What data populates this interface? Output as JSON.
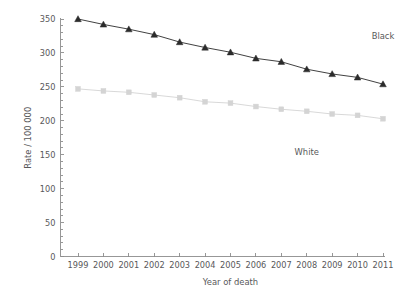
{
  "chart_data": {
    "type": "line",
    "title": "",
    "xlabel": "Year of death",
    "ylabel": "Rate / 100 000",
    "x": [
      1999,
      2000,
      2001,
      2002,
      2003,
      2004,
      2005,
      2006,
      2007,
      2008,
      2009,
      2010,
      2011
    ],
    "xticklabels": [
      "1999",
      "2000",
      "2001",
      "2002",
      "2003",
      "2004",
      "2005",
      "2006",
      "2007",
      "2008",
      "2009",
      "2010",
      "2011"
    ],
    "yticks": [
      0,
      50,
      100,
      150,
      200,
      250,
      300,
      350
    ],
    "yticklabels": [
      "0",
      "50",
      "100",
      "150",
      "200",
      "250",
      "300",
      "350"
    ],
    "ylim": [
      0,
      350
    ],
    "xlim": [
      1999,
      2011
    ],
    "grid": false,
    "legend": "inline-annotations",
    "series": [
      {
        "name": "Black",
        "marker": "triangle",
        "color": "#2b2b2b",
        "annotation": "Black",
        "annotation_x": 2011,
        "annotation_y": 320,
        "values": [
          350,
          342,
          335,
          327,
          316,
          308,
          301,
          292,
          287,
          276,
          269,
          264,
          254
        ]
      },
      {
        "name": "White",
        "marker": "square",
        "color": "#d4d4d4",
        "annotation": "White",
        "annotation_x": 2008,
        "annotation_y": 150,
        "values": [
          247,
          244,
          242,
          238,
          234,
          228,
          226,
          221,
          217,
          214,
          210,
          208,
          203
        ]
      }
    ]
  }
}
